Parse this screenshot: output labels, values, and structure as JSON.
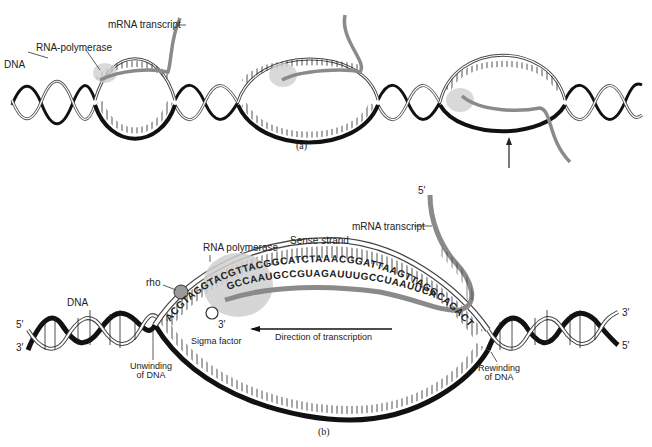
{
  "figure": {
    "panel_a": {
      "caption": "(a)",
      "labels": {
        "dna": "DNA",
        "rna_polymerase": "RNA-polymerase",
        "mrna_transcript": "mRNA transcript"
      }
    },
    "panel_b": {
      "caption": "(b)",
      "labels": {
        "dna": "DNA",
        "rna_polymerase": "RNA polymerase",
        "sense_strand": "Sense strand",
        "mrna_transcript": "mRNA transcript",
        "rho": "rho",
        "sigma_factor": "Sigma factor",
        "direction": "Direction of transcription",
        "unwinding": "Unwinding\nof DNA",
        "unwinding_line1": "Unwinding",
        "unwinding_line2": "of DNA",
        "rewinding_line1": "Rewinding",
        "rewinding_line2": "of DNA",
        "five_prime_left": "5′",
        "three_prime_left": "3′",
        "three_prime_right": "3′",
        "five_prime_right": "5′",
        "five_prime_mrna": "5′",
        "three_prime_mrna": "3′"
      },
      "sequences": {
        "dna_template": "ACGTAGGTACGTTACGGCATCTAAACGGATTAAGTTAGGCAGACT",
        "mrna": "GCCAAUGCCGUAGAUUUGCCUAAUUCA"
      }
    },
    "colors": {
      "strand_dark": "#111111",
      "strand_light_outline": "#333333",
      "mrna": "#8a8a8a",
      "polymerase_shade": "#cfcfcf",
      "rho": "#9a9a9a"
    }
  }
}
